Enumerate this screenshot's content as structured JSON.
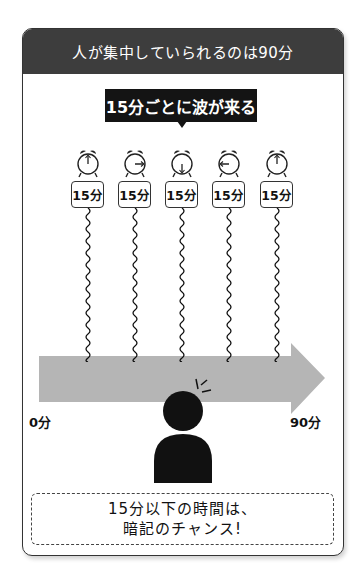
{
  "header": {
    "title": "人が集中していられるのは90分"
  },
  "callout": {
    "label": "15分ごとに波が来る"
  },
  "intervals": [
    {
      "label": "15分",
      "clock_hand": "up"
    },
    {
      "label": "15分",
      "clock_hand": "right"
    },
    {
      "label": "15分",
      "clock_hand": "down"
    },
    {
      "label": "15分",
      "clock_hand": "left"
    },
    {
      "label": "15分",
      "clock_hand": "up"
    }
  ],
  "timeline": {
    "start_label": "0分",
    "end_label": "90分",
    "arrow_color": "#b5b5b5"
  },
  "note": {
    "line1": "15分以下の時間は、",
    "line2": "暗記のチャンス!"
  },
  "colors": {
    "header_bg": "#3d3d3d",
    "callout_bg": "#141414",
    "person": "#111111"
  }
}
